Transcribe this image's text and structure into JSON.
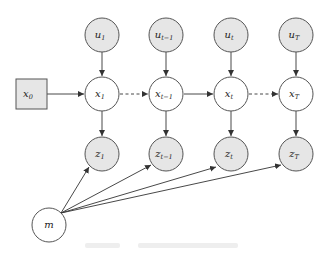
{
  "diagram": {
    "type": "graphical-model",
    "colors": {
      "observed_fill": "#e6e6e6",
      "latent_fill": "#ffffff",
      "stroke": "#555555",
      "edge": "#333333"
    },
    "nodes": {
      "x0": {
        "base": "x",
        "sub": "0",
        "shape": "square",
        "fill": "observed"
      },
      "u": [
        {
          "base": "u",
          "sub": "1"
        },
        {
          "base": "u",
          "sub": "t−1"
        },
        {
          "base": "u",
          "sub": "t"
        },
        {
          "base": "u",
          "sub": "T"
        }
      ],
      "x": [
        {
          "base": "x",
          "sub": "1"
        },
        {
          "base": "x",
          "sub": "t−1"
        },
        {
          "base": "x",
          "sub": "t"
        },
        {
          "base": "x",
          "sub": "T"
        }
      ],
      "z": [
        {
          "base": "z",
          "sub": "1"
        },
        {
          "base": "z",
          "sub": "t−1"
        },
        {
          "base": "z",
          "sub": "t"
        },
        {
          "base": "z",
          "sub": "T"
        }
      ],
      "m": {
        "base": "m",
        "sub": ""
      }
    },
    "edges": [
      {
        "from": "x0",
        "to": "x1",
        "style": "solid"
      },
      {
        "from": "x1",
        "to": "x_t-1",
        "style": "dashed"
      },
      {
        "from": "x_t-1",
        "to": "x_t",
        "style": "solid"
      },
      {
        "from": "x_t",
        "to": "x_T",
        "style": "dashed"
      },
      {
        "from": "u_i",
        "to": "x_i",
        "style": "solid"
      },
      {
        "from": "x_i",
        "to": "z_i",
        "style": "solid"
      },
      {
        "from": "m",
        "to": "z_i",
        "style": "solid"
      }
    ]
  }
}
